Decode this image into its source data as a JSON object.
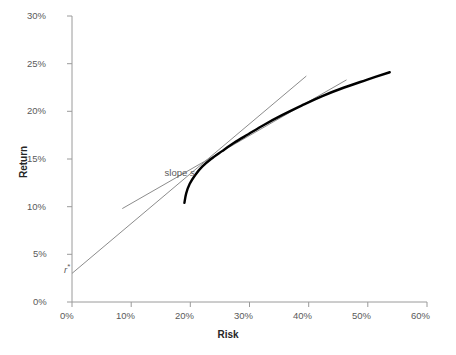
{
  "chart_data": {
    "type": "line",
    "title": "",
    "xlabel": "Risk",
    "ylabel": "Return",
    "xlim": [
      0,
      60
    ],
    "ylim": [
      0,
      30
    ],
    "x_ticks": [
      0,
      10,
      20,
      30,
      40,
      50,
      60
    ],
    "x_tick_labels": [
      "0%",
      "10%",
      "20%",
      "30%",
      "40%",
      "50%",
      "60%"
    ],
    "y_ticks": [
      0,
      5,
      10,
      15,
      20,
      25,
      30
    ],
    "y_tick_labels": [
      "0%",
      "5%",
      "10%",
      "15%",
      "20%",
      "25%",
      "30%"
    ],
    "grid": false,
    "legend": "none",
    "series": [
      {
        "name": "efficient-frontier",
        "style": "thick-black-curve",
        "color": "#000000",
        "width": 2.4,
        "points": [
          [
            19.0,
            10.4
          ],
          [
            19.3,
            11.4
          ],
          [
            19.9,
            12.4
          ],
          [
            20.8,
            13.3
          ],
          [
            22.0,
            14.2
          ],
          [
            23.5,
            15.0
          ],
          [
            25.3,
            15.8
          ],
          [
            27.4,
            16.7
          ],
          [
            29.8,
            17.6
          ],
          [
            32.5,
            18.6
          ],
          [
            35.5,
            19.6
          ],
          [
            38.8,
            20.6
          ],
          [
            42.3,
            21.6
          ],
          [
            46.0,
            22.5
          ],
          [
            49.8,
            23.3
          ],
          [
            53.7,
            24.1
          ]
        ]
      },
      {
        "name": "capital-market-line",
        "style": "thin-gray-line",
        "color": "#8c8c8c",
        "width": 1.0,
        "points": [
          [
            0.0,
            3.0
          ],
          [
            39.6,
            23.7
          ]
        ]
      },
      {
        "name": "secondary-tangent-line",
        "style": "thin-gray-line",
        "color": "#8c8c8c",
        "width": 1.0,
        "points": [
          [
            8.5,
            9.8
          ],
          [
            46.4,
            23.3
          ]
        ]
      }
    ],
    "annotations": [
      {
        "name": "slope-label",
        "text_prefix": "slope ",
        "text_symbol": "s",
        "x": 17.0,
        "y": 13.5
      },
      {
        "name": "risk-free-rate-label",
        "text_symbol": "r",
        "text_superscript": "*",
        "x": 0.0,
        "y": 3.0
      }
    ]
  },
  "axes": {
    "x_title": "Risk",
    "y_title": "Return",
    "x_labels": [
      "0%",
      "10%",
      "20%",
      "30%",
      "40%",
      "50%",
      "60%"
    ],
    "y_labels": [
      "30%",
      "25%",
      "20%",
      "15%",
      "10%",
      "5%",
      "0%"
    ]
  },
  "annotations": {
    "slope_prefix": "slope ",
    "slope_symbol": "s",
    "rstar_symbol": "r",
    "rstar_superscript": "*"
  },
  "colors": {
    "frontier": "#000000",
    "tangent_line": "#8c8c8c",
    "axis": "#9a9a9a",
    "tick_text": "#5a5a5a",
    "axis_title": "#262626",
    "background": "#ffffff"
  }
}
